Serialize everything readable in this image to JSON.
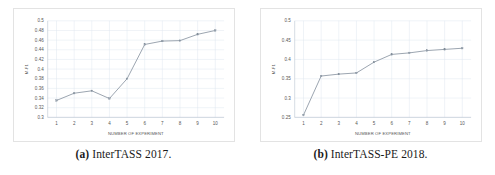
{
  "figure": {
    "layout": "two-panel-row",
    "background": "#ffffff"
  },
  "panels": [
    {
      "caption_label": "(a)",
      "caption_text": "InterTASS 2017.",
      "chart_data": {
        "type": "line",
        "title": "",
        "subtitle": "",
        "xlabel": "NUMBER OF EXPERIMENT",
        "ylabel": "M-F1",
        "x": [
          1,
          2,
          3,
          4,
          5,
          6,
          7,
          8,
          9,
          10
        ],
        "xticklabels": [
          "1",
          "2",
          "3",
          "4",
          "5",
          "6",
          "7",
          "8",
          "9",
          "10"
        ],
        "values": [
          0.335,
          0.35,
          0.355,
          0.339,
          0.38,
          0.451,
          0.458,
          0.459,
          0.472,
          0.48
        ],
        "yticklabels": [
          "0.5",
          "0.48",
          "0.46",
          "0.44",
          "0.42",
          "0.4",
          "0.38",
          "0.36",
          "0.34",
          "0.32",
          "0.3"
        ],
        "yticks": [
          0.5,
          0.48,
          0.46,
          0.44,
          0.42,
          0.4,
          0.38,
          0.36,
          0.34,
          0.32,
          0.3
        ],
        "ylim": [
          0.3,
          0.5
        ],
        "xlim": [
          0.5,
          10.5
        ],
        "grid": true,
        "legend": "none",
        "line_color": "#8f9aa6",
        "marker_color": "#9aa5b1",
        "grid_color": "#dfe6ef"
      }
    },
    {
      "caption_label": "(b)",
      "caption_text": "InterTASS-PE 2018.",
      "chart_data": {
        "type": "line",
        "title": "",
        "subtitle": "",
        "xlabel": "NUMBER OF EXPERIMENT",
        "ylabel": "M-F1",
        "x": [
          1,
          2,
          3,
          4,
          5,
          6,
          7,
          8,
          9,
          10
        ],
        "xticklabels": [
          "1",
          "2",
          "3",
          "4",
          "5",
          "6",
          "7",
          "8",
          "9",
          "10"
        ],
        "values": [
          0.256,
          0.357,
          0.362,
          0.365,
          0.393,
          0.413,
          0.417,
          0.423,
          0.426,
          0.429
        ],
        "yticklabels": [
          "0.5",
          "0.45",
          "0.4",
          "0.35",
          "0.3",
          "0.25"
        ],
        "yticks": [
          0.5,
          0.45,
          0.4,
          0.35,
          0.3,
          0.25
        ],
        "ylim": [
          0.25,
          0.5
        ],
        "xlim": [
          0.5,
          10.5
        ],
        "grid": true,
        "legend": "none",
        "line_color": "#8f9aa6",
        "marker_color": "#9aa5b1",
        "grid_color": "#dfe6ef"
      }
    }
  ]
}
